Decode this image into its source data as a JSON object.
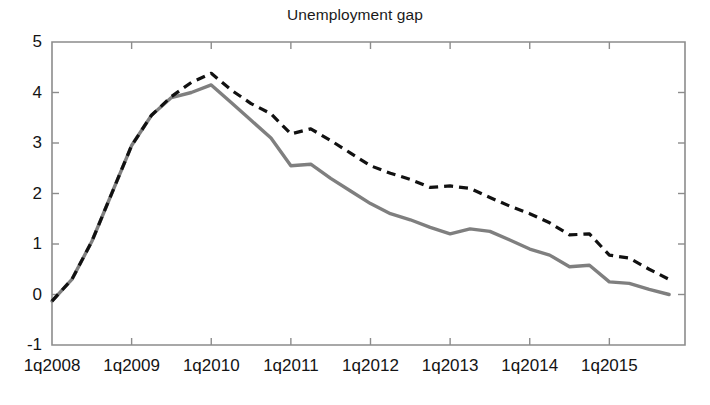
{
  "chart_data": {
    "type": "line",
    "title": "Unemployment gap",
    "xlabel": "",
    "ylabel": "",
    "ylim": [
      -1,
      5
    ],
    "yticks": [
      5,
      4,
      3,
      2,
      1,
      0,
      -1
    ],
    "ytick_labels": [
      "5",
      "4",
      "3",
      "2",
      "1",
      "0",
      "-1"
    ],
    "xtick_labels": [
      "1q2008",
      "1q2009",
      "1q2010",
      "1q2011",
      "1q2012",
      "1q2013",
      "1q2014",
      "1q2015"
    ],
    "x": [
      "1q2008",
      "2q2008",
      "3q2008",
      "4q2008",
      "1q2009",
      "2q2009",
      "3q2009",
      "4q2009",
      "1q2010",
      "2q2010",
      "3q2010",
      "4q2010",
      "1q2011",
      "2q2011",
      "3q2011",
      "4q2011",
      "1q2012",
      "2q2012",
      "3q2012",
      "4q2012",
      "1q2013",
      "2q2013",
      "3q2013",
      "4q2013",
      "1q2014",
      "2q2014",
      "3q2014",
      "4q2014",
      "1q2015",
      "2q2015",
      "3q2015",
      "4q2015"
    ],
    "grid": false,
    "legend": "none",
    "series": [
      {
        "name": "solid-gray-series",
        "style": "solid",
        "color": "#7f7f7f",
        "values": [
          -0.13,
          0.3,
          1.05,
          2.0,
          2.95,
          3.55,
          3.9,
          4.0,
          4.15,
          3.8,
          3.45,
          3.1,
          2.55,
          2.58,
          2.3,
          2.05,
          1.8,
          1.6,
          1.48,
          1.33,
          1.2,
          1.3,
          1.25,
          1.08,
          0.9,
          0.78,
          0.55,
          0.58,
          0.25,
          0.22,
          0.1,
          0.0
        ]
      },
      {
        "name": "dashed-black-series",
        "style": "dashed",
        "color": "#111111",
        "values": [
          -0.13,
          0.3,
          1.05,
          2.0,
          2.95,
          3.55,
          3.92,
          4.2,
          4.38,
          4.05,
          3.78,
          3.58,
          3.18,
          3.28,
          3.05,
          2.8,
          2.55,
          2.4,
          2.28,
          2.12,
          2.15,
          2.1,
          1.92,
          1.75,
          1.6,
          1.42,
          1.18,
          1.2,
          0.78,
          0.72,
          0.5,
          0.3
        ]
      }
    ]
  },
  "axes": {
    "x_start_label": "1q2008",
    "x_end_label": "4q2015"
  }
}
